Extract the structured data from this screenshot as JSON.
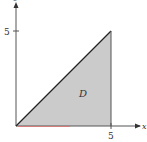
{
  "diagram": {
    "region_label": "D",
    "x_axis_label": "x",
    "y_axis_label": "y",
    "x_tick_label": "5",
    "y_tick_label": "5",
    "fill_color": "#c8c8c8",
    "line_color": "#222222",
    "axis_color": "#444444",
    "highlight_color": "#e07070"
  }
}
